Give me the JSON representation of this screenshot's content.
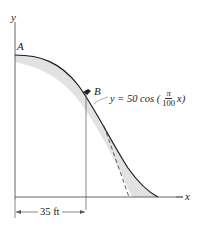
{
  "diagram": {
    "axes": {
      "x_label": "x",
      "y_label": "y"
    },
    "points": {
      "A": "A",
      "B": "B"
    },
    "equation": {
      "lhs": "y = 50 cos (",
      "fraction_numerator": "π",
      "fraction_denominator": "100",
      "rhs": "x)"
    },
    "dimension": {
      "label": "35 ft"
    },
    "colors": {
      "curve": "#1a1a1a",
      "fill": "#e4e4e4",
      "axis": "#555555"
    }
  }
}
